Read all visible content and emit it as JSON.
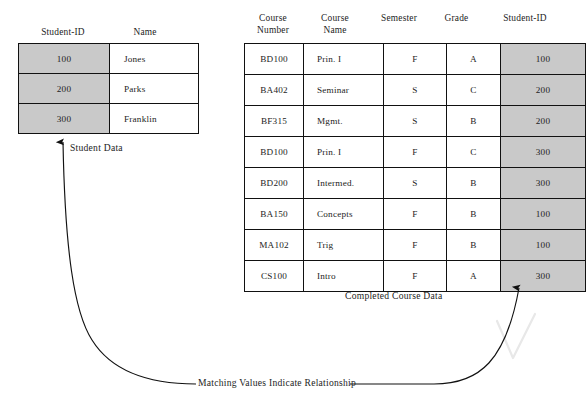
{
  "figure": {
    "cropped_top_text": "",
    "student_table": {
      "name": "Student Data",
      "headers": [
        "Student-ID",
        "Name"
      ],
      "key_column_index": 0,
      "rows": [
        {
          "student_id": "100",
          "name": "Jones"
        },
        {
          "student_id": "200",
          "name": "Parks"
        },
        {
          "student_id": "300",
          "name": "Franklin"
        }
      ]
    },
    "course_table": {
      "name": "Completed Course Data",
      "headers": [
        "Course\nNumber",
        "Course\nName",
        "Semester",
        "Grade",
        "Student-ID"
      ],
      "key_column_index": 4,
      "rows": [
        {
          "course_number": "BD100",
          "course_name": "Prin. I",
          "semester": "F",
          "grade": "A",
          "student_id": "100"
        },
        {
          "course_number": "BA402",
          "course_name": "Seminar",
          "semester": "S",
          "grade": "C",
          "student_id": "200"
        },
        {
          "course_number": "BF315",
          "course_name": "Mgmt.",
          "semester": "S",
          "grade": "B",
          "student_id": "200"
        },
        {
          "course_number": "BD100",
          "course_name": "Prin. I",
          "semester": "F",
          "grade": "C",
          "student_id": "300"
        },
        {
          "course_number": "BD200",
          "course_name": "Intermed.",
          "semester": "S",
          "grade": "B",
          "student_id": "300"
        },
        {
          "course_number": "BA150",
          "course_name": "Concepts",
          "semester": "F",
          "grade": "B",
          "student_id": "100"
        },
        {
          "course_number": "MA102",
          "course_name": "Trig",
          "semester": "F",
          "grade": "B",
          "student_id": "100"
        },
        {
          "course_number": "CS100",
          "course_name": "Intro",
          "semester": "F",
          "grade": "A",
          "student_id": "300"
        }
      ]
    },
    "relationship_label": "Matching Values Indicate Relationship",
    "colors": {
      "key_column_fill": "#c9c9c9",
      "border": "#111111",
      "text": "#1d1d1d",
      "arrow": "#111111"
    }
  }
}
